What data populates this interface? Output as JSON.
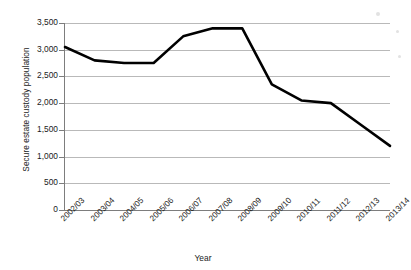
{
  "chart_data": {
    "type": "line",
    "title": "",
    "xlabel": "Year",
    "ylabel": "Secure estate custody population",
    "categories": [
      "2002/03",
      "2003/04",
      "2004/05",
      "2005/06",
      "2006/07",
      "2007/08",
      "2008/09",
      "2009/10",
      "2010/11",
      "2011/12",
      "2012/13",
      "2013/14"
    ],
    "series": [
      {
        "name": "Secure estate custody population",
        "values": [
          3050,
          2800,
          2750,
          2750,
          3250,
          3400,
          3400,
          2350,
          2050,
          2000,
          1600,
          1200
        ],
        "color": "#000000"
      }
    ],
    "ylim": [
      0,
      3500
    ],
    "ytick_values": [
      0,
      500,
      1000,
      1500,
      2000,
      2500,
      3000,
      3500
    ],
    "ytick_labels": [
      "0",
      "500",
      "1,000",
      "1,500",
      "2,000",
      "2,500",
      "3,000",
      "3,500"
    ],
    "grid": true,
    "legend": "none"
  },
  "axes": {
    "y_title": "Secure estate custody population",
    "x_title": "Year"
  }
}
